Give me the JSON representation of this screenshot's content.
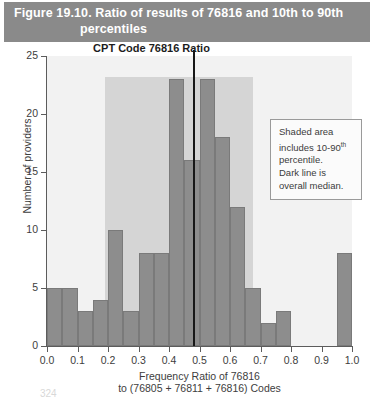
{
  "figure": {
    "title_line1": "Figure 19.10.  Ratio of results of 76816 and 10th to 90th",
    "title_line2": "percentiles",
    "page_number": "324"
  },
  "annotation": {
    "line1": "Shaded area",
    "line2_a": "includes 10-90",
    "line2_sup": "th",
    "line3": "percentile.",
    "line4": "Dark line is",
    "line5": "overall median."
  },
  "chart_data": {
    "type": "bar",
    "title": "CPT Code 76816 Ratio",
    "xlabel": "Frequency Ratio of 76816",
    "xlabel_line2": "to (76805 + 76811 + 76816) Codes",
    "ylabel": "Number of providers",
    "xlim": [
      0.0,
      1.0
    ],
    "ylim": [
      0,
      25
    ],
    "bin_width": 0.05,
    "grid": false,
    "legend": "none",
    "xticks": [
      "0.0",
      "0.1",
      "0.2",
      "0.3",
      "0.4",
      "0.5",
      "0.6",
      "0.7",
      "0.8",
      "0.9",
      "1.0"
    ],
    "xtick_values": [
      0.0,
      0.1,
      0.2,
      0.3,
      0.4,
      0.5,
      0.6,
      0.7,
      0.8,
      0.9,
      1.0
    ],
    "yticks": [
      "0",
      "5",
      "10",
      "15",
      "20",
      "25"
    ],
    "ytick_values": [
      0,
      5,
      10,
      15,
      20,
      25
    ],
    "bins": [
      {
        "x0": 0.0,
        "x1": 0.05,
        "value": 5
      },
      {
        "x0": 0.05,
        "x1": 0.1,
        "value": 5
      },
      {
        "x0": 0.1,
        "x1": 0.15,
        "value": 3
      },
      {
        "x0": 0.15,
        "x1": 0.2,
        "value": 4
      },
      {
        "x0": 0.2,
        "x1": 0.25,
        "value": 10
      },
      {
        "x0": 0.25,
        "x1": 0.3,
        "value": 3
      },
      {
        "x0": 0.3,
        "x1": 0.35,
        "value": 8
      },
      {
        "x0": 0.35,
        "x1": 0.4,
        "value": 8
      },
      {
        "x0": 0.4,
        "x1": 0.45,
        "value": 23
      },
      {
        "x0": 0.45,
        "x1": 0.5,
        "value": 16
      },
      {
        "x0": 0.5,
        "x1": 0.55,
        "value": 23
      },
      {
        "x0": 0.55,
        "x1": 0.6,
        "value": 18
      },
      {
        "x0": 0.6,
        "x1": 0.65,
        "value": 12
      },
      {
        "x0": 0.65,
        "x1": 0.7,
        "value": 5
      },
      {
        "x0": 0.7,
        "x1": 0.75,
        "value": 2
      },
      {
        "x0": 0.75,
        "x1": 0.8,
        "value": 3
      },
      {
        "x0": 0.8,
        "x1": 0.85,
        "value": 0
      },
      {
        "x0": 0.85,
        "x1": 0.9,
        "value": 0
      },
      {
        "x0": 0.9,
        "x1": 0.95,
        "value": 0
      },
      {
        "x0": 0.95,
        "x1": 1.0,
        "value": 8
      }
    ],
    "shaded_band": {
      "start": 0.19,
      "end": 0.675,
      "label": "10-90th percentile"
    },
    "median_line": {
      "x": 0.478,
      "label": "overall median"
    }
  },
  "colors": {
    "banner": "#8a8a8a",
    "bar": "#8d8d8d",
    "bar_border": "#7a7a7a",
    "shade": "#d5d5d5",
    "plot_background": "#f2f2f2",
    "median": "#171717",
    "axis": "#5c5c5c"
  }
}
